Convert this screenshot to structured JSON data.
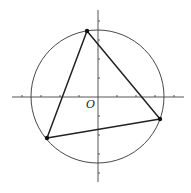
{
  "diagram": {
    "type": "geometry",
    "origin_label": "O",
    "colors": {
      "stroke": "#333333",
      "background": "#ffffff"
    },
    "axes": {
      "x": {
        "from": [
          12,
          97
        ],
        "to": [
          184,
          97
        ]
      },
      "y": {
        "from": [
          98,
          10
        ],
        "to": [
          98,
          182
        ]
      },
      "tick_spacing_px": 19
    },
    "circle": {
      "cx": 97.5,
      "cy": 96.5,
      "r": 66.5
    },
    "vertices": [
      {
        "name": "top",
        "x": 87,
        "y": 31
      },
      {
        "name": "right",
        "x": 160,
        "y": 119
      },
      {
        "name": "bottom-left",
        "x": 47,
        "y": 138
      }
    ]
  }
}
